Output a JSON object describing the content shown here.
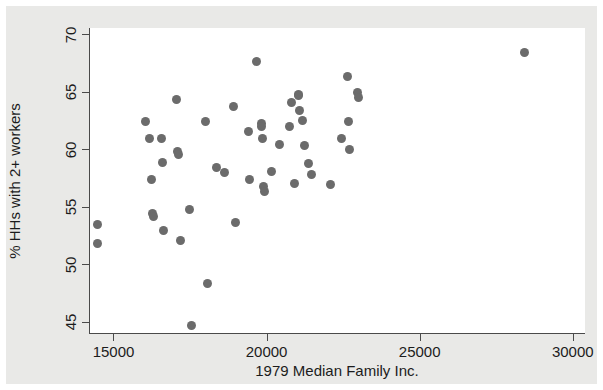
{
  "chart_data": {
    "type": "scatter",
    "title": "",
    "xlabel": "1979 Median Family Inc.",
    "ylabel": "% HHs with 2+ workers",
    "xlim": [
      14200,
      30400
    ],
    "ylim": [
      44.0,
      70.6
    ],
    "xticks": [
      15000,
      20000,
      25000,
      30000
    ],
    "xtick_labels": [
      "15000",
      "20000",
      "25000",
      "30000"
    ],
    "yticks": [
      45,
      50,
      55,
      60,
      65,
      70
    ],
    "ytick_labels": [
      "45",
      "50",
      "55",
      "60",
      "65",
      "70"
    ],
    "grid": false,
    "legend": null,
    "marker": {
      "shape": "circle",
      "color": "#6b6b6b",
      "size_px": 9
    },
    "n_points": 56,
    "series": [
      {
        "name": "metro areas",
        "points": [
          {
            "x": 14450,
            "y": 53.5
          },
          {
            "x": 14460,
            "y": 51.9
          },
          {
            "x": 16020,
            "y": 62.5
          },
          {
            "x": 16130,
            "y": 61.0
          },
          {
            "x": 16200,
            "y": 57.4
          },
          {
            "x": 16240,
            "y": 54.5
          },
          {
            "x": 16270,
            "y": 54.2
          },
          {
            "x": 16550,
            "y": 61.0
          },
          {
            "x": 16560,
            "y": 58.9
          },
          {
            "x": 16600,
            "y": 53.0
          },
          {
            "x": 17020,
            "y": 64.4
          },
          {
            "x": 17060,
            "y": 59.9
          },
          {
            "x": 17080,
            "y": 59.6
          },
          {
            "x": 17150,
            "y": 52.1
          },
          {
            "x": 17450,
            "y": 54.8
          },
          {
            "x": 17500,
            "y": 44.7
          },
          {
            "x": 17980,
            "y": 62.5
          },
          {
            "x": 18050,
            "y": 48.4
          },
          {
            "x": 18330,
            "y": 58.5
          },
          {
            "x": 18600,
            "y": 58.0
          },
          {
            "x": 18880,
            "y": 63.8
          },
          {
            "x": 18950,
            "y": 53.7
          },
          {
            "x": 19390,
            "y": 61.6
          },
          {
            "x": 19420,
            "y": 57.4
          },
          {
            "x": 19650,
            "y": 67.7
          },
          {
            "x": 19790,
            "y": 62.3
          },
          {
            "x": 19800,
            "y": 62.0
          },
          {
            "x": 19840,
            "y": 61.0
          },
          {
            "x": 19860,
            "y": 56.8
          },
          {
            "x": 19890,
            "y": 56.4
          },
          {
            "x": 20130,
            "y": 58.1
          },
          {
            "x": 20390,
            "y": 60.5
          },
          {
            "x": 20700,
            "y": 62.0
          },
          {
            "x": 20790,
            "y": 64.1
          },
          {
            "x": 20880,
            "y": 57.1
          },
          {
            "x": 21000,
            "y": 64.8
          },
          {
            "x": 21020,
            "y": 64.7
          },
          {
            "x": 21050,
            "y": 63.4
          },
          {
            "x": 21130,
            "y": 62.6
          },
          {
            "x": 21200,
            "y": 60.4
          },
          {
            "x": 21330,
            "y": 58.8
          },
          {
            "x": 21420,
            "y": 57.9
          },
          {
            "x": 22070,
            "y": 57.0
          },
          {
            "x": 22420,
            "y": 61.0
          },
          {
            "x": 22610,
            "y": 66.4
          },
          {
            "x": 22650,
            "y": 62.5
          },
          {
            "x": 22660,
            "y": 60.0
          },
          {
            "x": 22930,
            "y": 65.0
          },
          {
            "x": 22960,
            "y": 64.6
          },
          {
            "x": 28390,
            "y": 68.5
          }
        ]
      }
    ]
  },
  "figure": {
    "background_color": "#e9e9e7",
    "plot_background_color": "#ffffff",
    "axis_color": "#4a4a4a"
  }
}
